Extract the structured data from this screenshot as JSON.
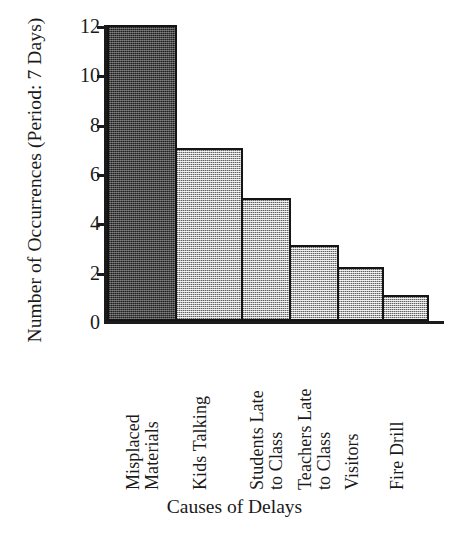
{
  "chart_data": {
    "type": "bar",
    "title": "",
    "xlabel": "Causes of Delays",
    "ylabel": "Number of Occurrences (Period: 7 Days)",
    "categories": [
      "Misplaced\nMaterials",
      "Kids Talking",
      "Students Late\nto Class",
      "Teachers Late\nto Class",
      "Visitors",
      "Fire Drill"
    ],
    "values": [
      12,
      7,
      5,
      3.1,
      2.2,
      1.05
    ],
    "ylim": [
      0,
      12
    ],
    "ytick_labels": [
      "0",
      "2",
      "4",
      "6",
      "8",
      "10",
      "12"
    ],
    "ytick_values": [
      0,
      2,
      4,
      6,
      8,
      10,
      12
    ],
    "grid": false,
    "legend": "none",
    "bar_colors": [
      "#474747",
      "#b4b4b4",
      "#b4b4b4",
      "#b4b4b4",
      "#b4b4b4",
      "#b4b4b4"
    ],
    "bar_edge_color": "#141414",
    "axis_color": "#1b1b1b",
    "background_color": "#ffffff",
    "bar_widths_px": [
      70,
      68,
      50,
      50,
      47,
      47
    ]
  }
}
